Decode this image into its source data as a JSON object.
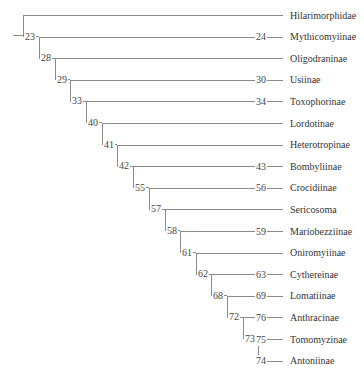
{
  "figure": {
    "type": "phylogenetic-tree",
    "line_color": "#8a8a8a"
  },
  "tips": [
    {
      "name": "Hilarimorphidae",
      "support": ""
    },
    {
      "name": "Mythicomyiinae",
      "support": "24"
    },
    {
      "name": "Oligodraninae",
      "support": ""
    },
    {
      "name": "Usiinae",
      "support": "30"
    },
    {
      "name": "Toxophorinae",
      "support": "34"
    },
    {
      "name": "Lordotinae",
      "support": ""
    },
    {
      "name": "Heterotropinae",
      "support": ""
    },
    {
      "name": "Bombyliinae",
      "support": "43"
    },
    {
      "name": "Crocidiinae",
      "support": "56"
    },
    {
      "name": "Sericosoma",
      "support": ""
    },
    {
      "name": "Mariobezziinae",
      "support": "59"
    },
    {
      "name": "Oniromyiinae",
      "support": ""
    },
    {
      "name": "Cythereinae",
      "support": "63"
    },
    {
      "name": "Lomatiinae",
      "support": "69"
    },
    {
      "name": "Anthracinae",
      "support": "76"
    },
    {
      "name": "Tomomyzinae",
      "support": "75"
    },
    {
      "name": "Antoniinae",
      "support": "74"
    }
  ],
  "internal_nodes": [
    {
      "label": "23"
    },
    {
      "label": "28"
    },
    {
      "label": "29"
    },
    {
      "label": "33"
    },
    {
      "label": "40"
    },
    {
      "label": "41"
    },
    {
      "label": "42"
    },
    {
      "label": "55"
    },
    {
      "label": "57"
    },
    {
      "label": "58"
    },
    {
      "label": "61"
    },
    {
      "label": "62"
    },
    {
      "label": "68"
    },
    {
      "label": "72"
    },
    {
      "label": "73"
    }
  ]
}
